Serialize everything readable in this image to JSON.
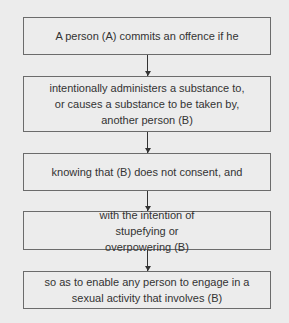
{
  "flowchart": {
    "steps": [
      {
        "label": "A person (A) commits an offence if he"
      },
      {
        "label": "intentionally administers a substance to, or causes a substance to be taken by, another person (B)"
      },
      {
        "label": "knowing that (B) does not consent, and"
      },
      {
        "label": "with the intention of stupefying or overpowering (B)"
      },
      {
        "label": "so as to enable any person to engage in a sexual activity that involves (B)"
      }
    ],
    "connectors": [
      {
        "from": 0,
        "to": 1,
        "type": "arrow-down"
      },
      {
        "from": 1,
        "to": 2,
        "type": "arrow-down"
      },
      {
        "from": 2,
        "to": 3,
        "type": "arrow-down"
      },
      {
        "from": 3,
        "to": 4,
        "type": "arrow-down"
      }
    ],
    "colors": {
      "background": "#ececec",
      "border": "#6b6b6b",
      "text": "#333333",
      "arrow": "#333333"
    }
  }
}
